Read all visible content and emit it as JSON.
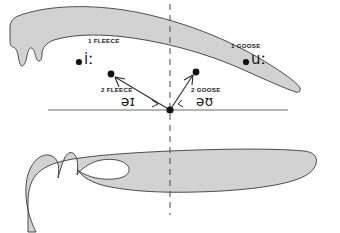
{
  "diagram": {
    "type": "sagittal-vocal-tract",
    "colors": {
      "tract_fill": "#d2d2d2",
      "tract_stroke": "#3a3a3a",
      "line": "#6b6b6b",
      "marker": "#111111",
      "text": "#1a1a1a",
      "background": "#ffffff"
    },
    "reference_lines": {
      "horizontal": {
        "x1": 48,
        "y": 110,
        "x2": 288,
        "style": "solid"
      },
      "vertical": {
        "x": 170,
        "y1": 4,
        "y2": 215,
        "style": "dashed"
      }
    },
    "origin_point": {
      "x": 170,
      "y": 110,
      "label": "schwa-origin"
    }
  },
  "markers": [
    {
      "id": "fleece-1",
      "tag": "1 FLEECE",
      "ipa": "iː",
      "dot": {
        "x": 79,
        "y": 62
      },
      "tag_pos": {
        "x": 88,
        "y": 42
      },
      "ipa_pos": {
        "x": 84,
        "y": 54
      }
    },
    {
      "id": "goose-1",
      "tag": "1 GOOSE",
      "ipa": "uː",
      "dot": {
        "x": 246,
        "y": 62
      },
      "tag_pos": {
        "x": 231,
        "y": 46
      },
      "ipa_pos": {
        "x": 251,
        "y": 54
      }
    },
    {
      "id": "fleece-2",
      "tag": "2 FLEECE",
      "ipa": "əɪ",
      "dot": {
        "x": 111,
        "y": 74
      },
      "tag_pos": {
        "x": 103,
        "y": 88
      },
      "ipa_pos": {
        "x": 122,
        "y": 95
      }
    },
    {
      "id": "goose-2",
      "tag": "2 GOOSE",
      "ipa": "əʊ",
      "dot": {
        "x": 196,
        "y": 72
      },
      "tag_pos": {
        "x": 192,
        "y": 88
      },
      "ipa_pos": {
        "x": 196,
        "y": 95
      }
    }
  ],
  "arrows": [
    {
      "id": "arrow-to-fleece-2",
      "from": {
        "x": 170,
        "y": 110
      },
      "to": {
        "x": 113,
        "y": 76
      }
    },
    {
      "id": "arrow-to-goose-2",
      "from": {
        "x": 170,
        "y": 110
      },
      "to": {
        "x": 194,
        "y": 74
      }
    }
  ],
  "shapes": {
    "palate": "M 16,34 C 14,22 20,14 32,12 C 56,9 96,13 132,20 C 172,28 218,42 252,58 C 272,67 286,72 292,72 C 296,72 297,70 296,67 C 292,58 276,44 252,32 C 214,13 166,2 124,1 C 96,0 62,1 40,5 C 24,8 16,14 14,22 C 12,30 13,40 14,48 C 15,55 17,60 19,62 C 21,64 23,62 23,58 C 23,54 24,52 26,52 C 28,52 29,55 30,60 C 31,65 33,68 35,68 C 37,68 38,64 39,60 C 40,56 42,54 45,54 C 50,54 56,55 60,55 C 64,55 66,52 64,48 C 58,41 40,38 30,37 C 22,36 18,36 16,34 Z",
    "tongue": "M 20,182 C 16,172 18,162 26,157 C 33,153 41,154 45,159 C 48,163 49,169 49,175 C 49,170 50,161 53,156 C 56,151 60,150 63,154 C 66,158 66,166 65,173 C 68,167 74,161 82,158 C 92,154 104,154 112,158 C 118,161 120,166 117,170 C 113,175 104,177 94,176 C 86,175 80,173 76,171 C 80,177 90,182 102,184 C 118,187 140,188 166,188 C 210,188 252,183 276,174 C 292,168 300,160 302,152 C 303,146 300,141 292,141 C 266,141 222,143 184,145 C 146,147 108,149 86,152 C 68,155 56,159 48,164 C 40,169 34,176 32,184 C 30,192 30,202 32,212 L 22,212 C 18,202 17,190 20,182 Z"
  }
}
